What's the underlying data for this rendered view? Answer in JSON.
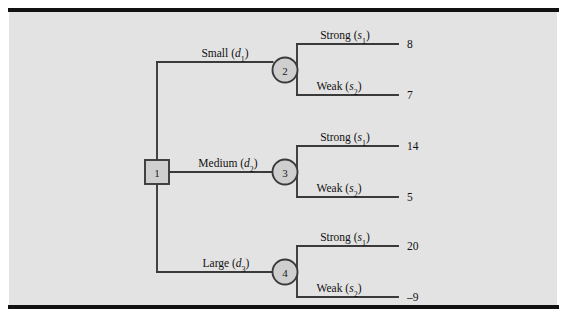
{
  "figure": {
    "type": "decision-tree",
    "background_color": "#e3e3e3",
    "page_color": "#ffffff",
    "rule_color": "#111111",
    "line_color": "#3a3a3a",
    "node_fill": "#cfcfcf"
  },
  "nodes": [
    {
      "id": "1",
      "label": "1",
      "shape": "square",
      "role": "decision",
      "x": 157,
      "y": 172
    },
    {
      "id": "2",
      "label": "2",
      "shape": "circle",
      "role": "chance",
      "x": 285,
      "y": 70
    },
    {
      "id": "3",
      "label": "3",
      "shape": "circle",
      "role": "chance",
      "x": 285,
      "y": 172
    },
    {
      "id": "4",
      "label": "4",
      "shape": "circle",
      "role": "chance",
      "x": 285,
      "y": 272
    }
  ],
  "decision_branches": [
    {
      "name": "small",
      "text": "Small",
      "var": "d",
      "sub": "1",
      "to_node": "2",
      "label_x": 225,
      "label_y": 57,
      "y": 62
    },
    {
      "name": "medium",
      "text": "Medium",
      "var": "d",
      "sub": "2",
      "to_node": "3",
      "label_x": 228,
      "label_y": 167,
      "y": 172
    },
    {
      "name": "large",
      "text": "Large",
      "var": "d",
      "sub": "3",
      "to_node": "4",
      "label_x": 226,
      "label_y": 267,
      "y": 272
    }
  ],
  "outcome_branches": [
    {
      "name": "strong-2",
      "from_node": "2",
      "text": "Strong",
      "var": "s",
      "sub": "1",
      "payoff": "8",
      "label_x": 345,
      "label_y": 39,
      "y": 44
    },
    {
      "name": "weak-2",
      "from_node": "2",
      "text": "Weak",
      "var": "s",
      "sub": "2",
      "payoff": "7",
      "label_x": 339,
      "label_y": 90,
      "y": 95
    },
    {
      "name": "strong-3",
      "from_node": "3",
      "text": "Strong",
      "var": "s",
      "sub": "1",
      "payoff": "14",
      "label_x": 345,
      "label_y": 141,
      "y": 146
    },
    {
      "name": "weak-3",
      "from_node": "3",
      "text": "Weak",
      "var": "s",
      "sub": "2",
      "payoff": "5",
      "label_x": 339,
      "label_y": 192,
      "y": 197
    },
    {
      "name": "strong-4",
      "from_node": "4",
      "text": "Strong",
      "var": "s",
      "sub": "1",
      "payoff": "20",
      "label_x": 345,
      "label_y": 241,
      "y": 246
    },
    {
      "name": "weak-4",
      "from_node": "4",
      "text": "Weak",
      "var": "s",
      "sub": "2",
      "payoff": "–9",
      "label_x": 339,
      "label_y": 292,
      "y": 297
    }
  ],
  "geometry": {
    "trunk_x": 157,
    "stub_x": 297,
    "payoff_line_end_x": 398,
    "payoff_text_x": 407,
    "square_half": 12,
    "circle_r": 12.5
  }
}
